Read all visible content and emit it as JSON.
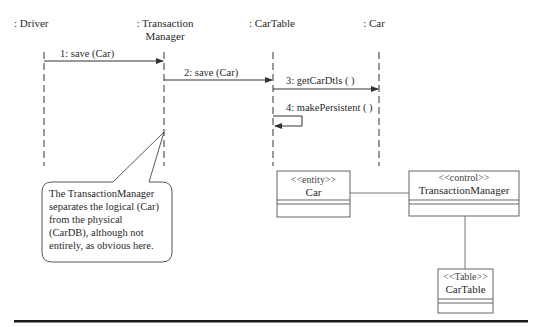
{
  "lifelines": [
    {
      "label": ": Driver"
    },
    {
      "label": ": Transaction",
      "label2": "Manager"
    },
    {
      "label": ": CarTable"
    },
    {
      "label": ": Car"
    }
  ],
  "messages": [
    {
      "label": "1: save (Car)"
    },
    {
      "label": "2: save (Car)"
    },
    {
      "label": "3: getCarDtls ( )"
    },
    {
      "label": "4: makePersistent ( )"
    }
  ],
  "note": {
    "lines": [
      "The TransactionManager",
      "separates the logical (Car)",
      "from the physical",
      "(CarDB), although not",
      "entirely, as obvious here."
    ]
  },
  "classes": [
    {
      "stereotype": "<<entity>>",
      "name": "Car"
    },
    {
      "stereotype": "<<control>>",
      "name": "TransactionManager"
    },
    {
      "stereotype": "<<Table>>",
      "name": "CarTable"
    }
  ]
}
